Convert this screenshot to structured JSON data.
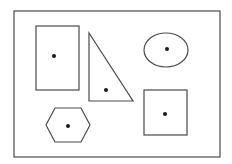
{
  "diagram": {
    "colors": {
      "background": "#ffffff",
      "stroke": "#4a4a4a",
      "dot": "#1a1a1a"
    },
    "shapes": [
      {
        "id": "rectangle",
        "type": "rectangle",
        "has_center_dot": true
      },
      {
        "id": "right-triangle",
        "type": "triangle",
        "has_center_dot": true
      },
      {
        "id": "ellipse",
        "type": "ellipse",
        "has_center_dot": true
      },
      {
        "id": "hexagon",
        "type": "hexagon",
        "has_center_dot": true
      },
      {
        "id": "square",
        "type": "square",
        "has_center_dot": true
      }
    ]
  }
}
